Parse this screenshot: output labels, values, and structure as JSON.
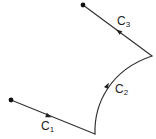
{
  "diagram": {
    "type": "piecewise-curve",
    "stroke_color": "#333333",
    "curves": [
      {
        "name": "C1",
        "label_base": "C",
        "label_sub": "1",
        "shape": "line-segment",
        "from": [
          11,
          100
        ],
        "to": [
          95,
          134
        ]
      },
      {
        "name": "C2",
        "label_base": "C",
        "label_sub": "2",
        "shape": "arc",
        "from": [
          95,
          134
        ],
        "to": [
          152,
          56
        ]
      },
      {
        "name": "C3",
        "label_base": "C",
        "label_sub": "3",
        "shape": "line-segment",
        "from": [
          152,
          56
        ],
        "to": [
          83,
          5
        ]
      }
    ],
    "start_point": [
      11,
      100
    ],
    "end_point": [
      83,
      5
    ]
  }
}
